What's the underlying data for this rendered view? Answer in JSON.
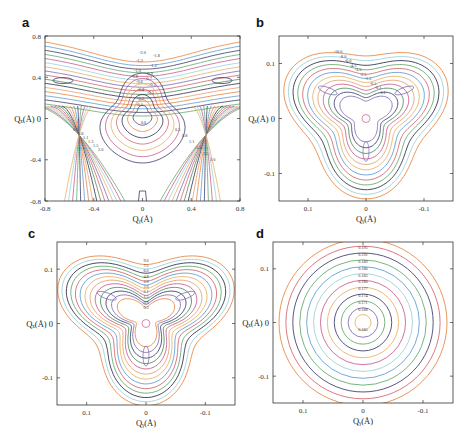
{
  "chart_data": [
    {
      "panel": "a",
      "type": "contour",
      "xlabel": "Q_y(Å)",
      "ylabel": "Q_x(Å)",
      "xlim": [
        -0.8,
        0.8
      ],
      "ylim": [
        -0.8,
        0.8
      ],
      "xticks": [
        "-0.8",
        "-0.4",
        "0",
        "0.4",
        "0.8"
      ],
      "yticks": [
        "0.8",
        "0.4",
        "0",
        "-0.4",
        "-0.8"
      ],
      "contour_labels": [
        "-2.0",
        "-1.8",
        "-1.3",
        "-1.2",
        "-1.0",
        "-0.9",
        "-0.8",
        "-0.7",
        "-0.6",
        "-0.5",
        "-0.4",
        "-0.3",
        "-0.2",
        "-0.1",
        "0.0",
        "0.5",
        "0.8",
        "1.1",
        "1.3",
        "1.5",
        "2.0"
      ],
      "levels": 16
    },
    {
      "panel": "b",
      "type": "contour",
      "xlabel": "Q_y(Å)",
      "ylabel": "Q_x(Å)",
      "xlim": [
        0.15,
        -0.15
      ],
      "ylim": [
        -0.15,
        0.15
      ],
      "xticks": [
        "0.1",
        "0",
        "-0.1"
      ],
      "yticks": [
        "0.1",
        "0",
        "-0.1"
      ],
      "contour_labels": [
        "-10.0",
        "-8.0",
        "-6.0",
        "-4.5",
        "-3.5",
        "-2.5",
        "-1.5",
        "-0.5",
        "-0.1",
        "0.1"
      ],
      "levels": 12
    },
    {
      "panel": "c",
      "type": "contour",
      "xlabel": "Q_y(Å)",
      "ylabel": "Q_x(Å)",
      "xlim": [
        0.15,
        -0.15
      ],
      "ylim": [
        -0.15,
        0.15
      ],
      "xticks": [
        "0.1",
        "0",
        "-0.1"
      ],
      "yticks": [
        "0.1",
        "0",
        "-0.1"
      ],
      "contour_labels": [
        "9.0",
        "7.5",
        "6.0",
        "4.8",
        "3.9",
        "3.0",
        "2.1",
        "1.5",
        "0.9",
        "0.3"
      ],
      "levels": 13
    },
    {
      "panel": "d",
      "type": "contour",
      "xlabel": "Q_y(Å)",
      "ylabel": "Q_x(Å)",
      "xlim": [
        0.15,
        -0.15
      ],
      "ylim": [
        -0.15,
        0.15
      ],
      "xticks": [
        "0.1",
        "0",
        "-0.1"
      ],
      "yticks": [
        "0.1",
        "0",
        "-0.1"
      ],
      "contour_labels": [
        "0.198",
        "0.195",
        "0.192",
        "0.189",
        "0.186",
        "0.183",
        "0.180",
        "0.177",
        "0.174",
        "0.171",
        "0.168",
        "0.165"
      ],
      "levels": 12
    }
  ],
  "palette": [
    "#e8833a",
    "#5a9bd5",
    "#3a3a6a",
    "#5fa86a",
    "#c75a8a",
    "#9ad0d8",
    "#e8b060",
    "#7a6ab0",
    "#d4626a",
    "#4a8a5a",
    "#2a2a4a",
    "#e0a070"
  ]
}
